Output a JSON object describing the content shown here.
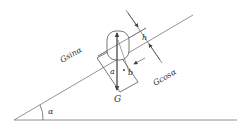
{
  "diagram": {
    "labels": {
      "component_parallel": "Gsinα",
      "component_perpendicular": "Gcosα",
      "weight": "G",
      "angle": "α",
      "dim_a": "a",
      "dim_b": "b",
      "dim_h": "h"
    },
    "colors": {
      "line": "#555555",
      "text": "#333333",
      "background": "#ffffff"
    }
  }
}
